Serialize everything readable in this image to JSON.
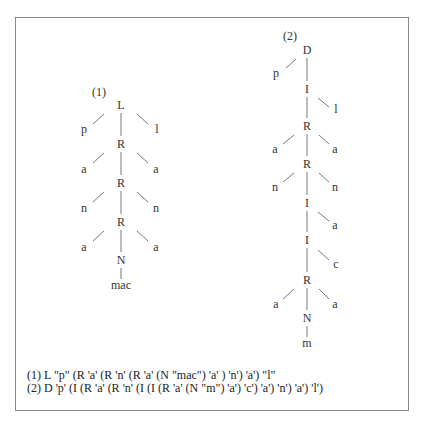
{
  "figure": {
    "trees": [
      {
        "label": "(1)",
        "nodes": [
          "L",
          "p",
          "l",
          "R",
          "a",
          "a",
          "R",
          "n",
          "n",
          "R",
          "a",
          "a",
          "N",
          "mac"
        ]
      },
      {
        "label": "(2)",
        "nodes": [
          "D",
          "p",
          "I",
          "l",
          "R",
          "a",
          "a",
          "R",
          "n",
          "n",
          "I",
          "a",
          "I",
          "c",
          "R",
          "a",
          "a",
          "N",
          "m"
        ]
      }
    ],
    "captions": [
      "(1) L \"p\" (R 'a' (R 'n' (R 'a' (N \"mac\") 'a' ) 'n') 'a') \"l\"",
      "(2) D 'p' (I (R 'a' (R 'n' (I (I (R 'a' (N \"m\") 'a') 'c') 'a') 'n') 'a') 'l')"
    ]
  }
}
